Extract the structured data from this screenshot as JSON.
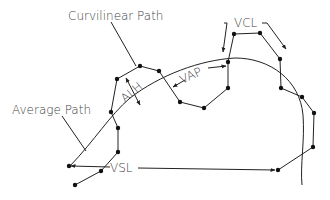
{
  "diagram": {
    "labels": {
      "curvilinear_path": "Curvilinear Path",
      "average_path": "Average Path",
      "alh": "ALH",
      "vap": "VAP",
      "vcl": "VCL",
      "vsl": "VSL"
    },
    "colors": {
      "line": "#222222",
      "text": "#444444",
      "background": "#ffffff"
    },
    "curvilinear_points": [
      [
        75,
        185
      ],
      [
        101,
        171
      ],
      [
        118,
        152
      ],
      [
        118,
        128
      ],
      [
        111,
        112
      ],
      [
        117,
        79
      ],
      [
        140,
        66
      ],
      [
        159,
        71
      ],
      [
        180,
        102
      ],
      [
        204,
        108
      ],
      [
        228,
        88
      ],
      [
        228,
        62
      ],
      [
        234,
        34
      ],
      [
        260,
        33
      ],
      [
        280,
        59
      ],
      [
        281,
        88
      ],
      [
        302,
        97
      ],
      [
        314,
        113
      ],
      [
        313,
        147
      ],
      [
        278,
        170
      ]
    ],
    "vsl_endpoints": [
      [
        69,
        166
      ],
      [
        275,
        170
      ]
    ]
  }
}
